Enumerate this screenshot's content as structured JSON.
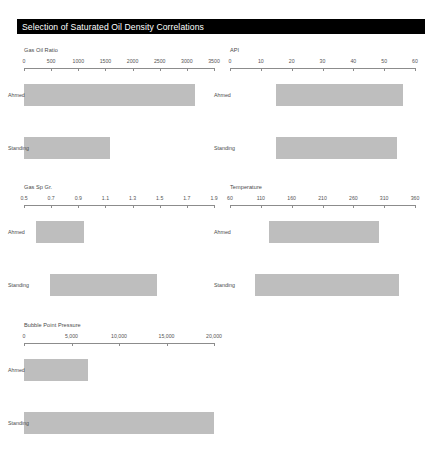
{
  "document": {
    "title": "Selection of Saturated Oil Density Correlations"
  },
  "row_labels": {
    "ahmed": "Ahmed",
    "standing": "Standing"
  },
  "chart_data": {
    "type": "bar",
    "title": "Selection of Saturated Oil Density Correlations",
    "orientation": "horizontal",
    "grid": false,
    "legend": false,
    "series_names": [
      "Ahmed",
      "Standing"
    ],
    "panels": [
      {
        "id": "gas-oil-ratio",
        "xlabel": "Gas Oil Ratio",
        "ticks": [
          "0",
          "500",
          "1000",
          "1500",
          "2000",
          "2500",
          "3000",
          "3500"
        ],
        "tick_values": [
          0,
          500,
          1000,
          1500,
          2000,
          2500,
          3000,
          3500
        ],
        "xlim": [
          0,
          3500
        ],
        "bars": [
          {
            "name": "Ahmed",
            "start": 0,
            "end": 3150
          },
          {
            "name": "Standing",
            "start": 0,
            "end": 1580
          }
        ]
      },
      {
        "id": "api",
        "xlabel": "API",
        "ticks": [
          "0",
          "10",
          "20",
          "30",
          "40",
          "50",
          "60"
        ],
        "tick_values": [
          0,
          10,
          20,
          30,
          40,
          50,
          60
        ],
        "xlim": [
          0,
          60
        ],
        "bars": [
          {
            "name": "Ahmed",
            "start": 15,
            "end": 56
          },
          {
            "name": "Standing",
            "start": 15,
            "end": 54
          }
        ]
      },
      {
        "id": "gas-sp-gr",
        "xlabel": "Gas Sp Gr.",
        "ticks": [
          "0.5",
          "0.7",
          "0.9",
          "1.1",
          "1.3",
          "1.5",
          "1.7",
          "1.9"
        ],
        "tick_values": [
          0.5,
          0.7,
          0.9,
          1.1,
          1.3,
          1.5,
          1.7,
          1.9
        ],
        "xlim": [
          0.5,
          1.9
        ],
        "bars": [
          {
            "name": "Ahmed",
            "start": 0.59,
            "end": 0.94
          },
          {
            "name": "Standing",
            "start": 0.69,
            "end": 1.48
          }
        ]
      },
      {
        "id": "temperature",
        "xlabel": "Temperature",
        "ticks": [
          "60",
          "110",
          "160",
          "210",
          "260",
          "310",
          "360"
        ],
        "tick_values": [
          60,
          110,
          160,
          210,
          260,
          310,
          360
        ],
        "xlim": [
          60,
          360
        ],
        "bars": [
          {
            "name": "Ahmed",
            "start": 124,
            "end": 302
          },
          {
            "name": "Standing",
            "start": 100,
            "end": 334
          }
        ]
      },
      {
        "id": "bubble-point-pressure",
        "xlabel": "Bubble Point Pressure",
        "ticks": [
          "0",
          "5,000",
          "10,000",
          "15,000",
          "20,000"
        ],
        "tick_values": [
          0,
          5000,
          10000,
          15000,
          20000
        ],
        "xlim": [
          0,
          20000
        ],
        "bars": [
          {
            "name": "Ahmed",
            "start": 0,
            "end": 6700
          },
          {
            "name": "Standing",
            "start": 0,
            "end": 20000
          }
        ]
      }
    ]
  }
}
